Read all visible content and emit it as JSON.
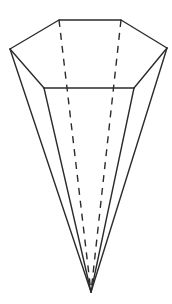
{
  "figure": {
    "title": "",
    "shape": "hexagonal pyramid (inverted)",
    "stroke_color": "#2b2b2b",
    "background": "#ffffff",
    "apex": [
      91,
      292
    ],
    "base_vertices": {
      "back_left": [
        59,
        20
      ],
      "back_right": [
        121,
        20
      ],
      "right": [
        167,
        48
      ],
      "front_right": [
        134,
        88
      ],
      "front_left": [
        44,
        88
      ],
      "left": [
        10,
        49
      ]
    },
    "visible_edges": [
      [
        "back_left",
        "back_right"
      ],
      [
        "back_right",
        "right"
      ],
      [
        "right",
        "front_right"
      ],
      [
        "front_right",
        "front_left"
      ],
      [
        "front_left",
        "left"
      ],
      [
        "left",
        "back_left"
      ],
      [
        "left",
        "apex"
      ],
      [
        "front_left",
        "apex"
      ],
      [
        "front_right",
        "apex"
      ],
      [
        "right",
        "apex"
      ]
    ],
    "hidden_edges": [
      [
        "back_left",
        "apex"
      ],
      [
        "back_right",
        "apex"
      ]
    ]
  }
}
